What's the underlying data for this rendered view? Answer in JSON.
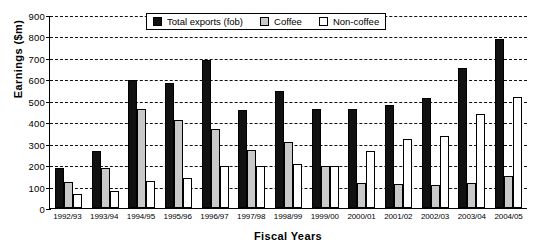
{
  "chart_data": {
    "type": "bar",
    "title": "",
    "xlabel": "Fiscal Years",
    "ylabel": "Earnings ($m)",
    "ylim": [
      0,
      900
    ],
    "ytick_step": 100,
    "yticks": [
      0,
      100,
      200,
      300,
      400,
      500,
      600,
      700,
      800,
      900
    ],
    "grid": true,
    "legend_position": "top-center",
    "categories": [
      "1992/93",
      "1993/94",
      "1994/95",
      "1995/96",
      "1996/97",
      "1997/98",
      "1998/99",
      "1999/00",
      "2000/01",
      "2001/02",
      "2002/03",
      "2003/04",
      "2004/05"
    ],
    "series": [
      {
        "name": "Total exports (fob)",
        "color": "#111111",
        "values": [
          185,
          265,
          595,
          585,
          690,
          455,
          548,
          462,
          462,
          480,
          512,
          655,
          790
        ]
      },
      {
        "name": "Coffee",
        "color": "#c9c9c9",
        "values": [
          120,
          185,
          460,
          410,
          370,
          270,
          310,
          198,
          115,
          110,
          108,
          118,
          148
        ]
      },
      {
        "name": "Non-coffee",
        "color": "#ffffff",
        "values": [
          65,
          80,
          125,
          140,
          198,
          195,
          205,
          196,
          268,
          320,
          335,
          440,
          520
        ]
      }
    ]
  },
  "legend": {
    "items": [
      {
        "label": "Total exports (fob)",
        "swatch": "total"
      },
      {
        "label": "Coffee",
        "swatch": "coffee"
      },
      {
        "label": "Non-coffee",
        "swatch": "noncoffee"
      }
    ]
  }
}
